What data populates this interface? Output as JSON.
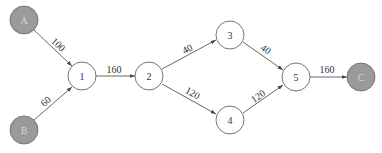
{
  "diagram": {
    "type": "directed-flow-network",
    "nodes": [
      {
        "id": "A",
        "label": "A",
        "kind": "source",
        "x": 24,
        "y": 20
      },
      {
        "id": "B",
        "label": "B",
        "kind": "source",
        "x": 24,
        "y": 130
      },
      {
        "id": "1",
        "label": "1",
        "kind": "intermediate",
        "x": 82,
        "y": 76
      },
      {
        "id": "2",
        "label": "2",
        "kind": "intermediate",
        "x": 149,
        "y": 76
      },
      {
        "id": "3",
        "label": "3",
        "kind": "intermediate",
        "x": 230,
        "y": 35
      },
      {
        "id": "4",
        "label": "4",
        "kind": "intermediate",
        "x": 230,
        "y": 120
      },
      {
        "id": "5",
        "label": "5",
        "kind": "intermediate",
        "x": 296,
        "y": 77
      },
      {
        "id": "C",
        "label": "C",
        "kind": "sink",
        "x": 361,
        "y": 77
      }
    ],
    "edges": [
      {
        "from": "A",
        "to": "1",
        "label": "100"
      },
      {
        "from": "B",
        "to": "1",
        "label": "60"
      },
      {
        "from": "1",
        "to": "2",
        "label": "160"
      },
      {
        "from": "2",
        "to": "3",
        "label": "40"
      },
      {
        "from": "2",
        "to": "4",
        "label": "120"
      },
      {
        "from": "3",
        "to": "5",
        "label": "40"
      },
      {
        "from": "4",
        "to": "5",
        "label": "120"
      },
      {
        "from": "5",
        "to": "C",
        "label": "160"
      }
    ],
    "colors": {
      "filled_node": "#9a9a9a",
      "open_node": "#ffffff",
      "edge": "#555555"
    }
  }
}
